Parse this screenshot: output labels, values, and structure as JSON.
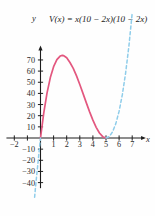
{
  "chart_data": {
    "type": "line",
    "title": "V(x) = x(10 − 2x)(10 − 2x)",
    "xlabel": "x",
    "ylabel": "y",
    "xlim": [
      -2.6,
      7.8
    ],
    "ylim": [
      -45,
      80
    ],
    "grid": false,
    "legend": null,
    "x_ticks": [
      -2,
      -1,
      1,
      2,
      3,
      4,
      5,
      6,
      7
    ],
    "x_tick_labels": [
      "−2",
      "",
      "1",
      "2",
      "3",
      "4",
      "5",
      "6",
      "7"
    ],
    "y_ticks": [
      -40,
      -30,
      -20,
      -10,
      10,
      20,
      30,
      40,
      50,
      60,
      70
    ],
    "y_tick_labels": [
      "−40",
      "−30",
      "−20",
      "−10",
      "10",
      "20",
      "30",
      "40",
      "50",
      "60",
      "70"
    ],
    "series": [
      {
        "name": "V(x) solid relevant domain",
        "style": "solid",
        "color": "#E3577F",
        "domain": [
          0,
          5
        ],
        "points": [
          {
            "x": 0.0,
            "y": 0
          },
          {
            "x": 0.25,
            "y": 22.56
          },
          {
            "x": 0.5,
            "y": 40.5
          },
          {
            "x": 0.75,
            "y": 54.19
          },
          {
            "x": 1.0,
            "y": 64.0
          },
          {
            "x": 1.25,
            "y": 70.31
          },
          {
            "x": 1.5,
            "y": 73.5
          },
          {
            "x": 1.667,
            "y": 74.07
          },
          {
            "x": 1.75,
            "y": 73.94
          },
          {
            "x": 2.0,
            "y": 72.0
          },
          {
            "x": 2.25,
            "y": 67.69
          },
          {
            "x": 2.5,
            "y": 62.5
          },
          {
            "x": 2.75,
            "y": 55.69
          },
          {
            "x": 3.0,
            "y": 48.0
          },
          {
            "x": 3.25,
            "y": 39.81
          },
          {
            "x": 3.5,
            "y": 31.5
          },
          {
            "x": 3.75,
            "y": 23.44
          },
          {
            "x": 4.0,
            "y": 16.0
          },
          {
            "x": 4.25,
            "y": 9.56
          },
          {
            "x": 4.5,
            "y": 4.5
          },
          {
            "x": 4.75,
            "y": 1.19
          },
          {
            "x": 5.0,
            "y": 0.0
          }
        ]
      },
      {
        "name": "V(x) dashed extension right",
        "style": "dashed",
        "color": "#8FCDEA",
        "domain": [
          5,
          7.3
        ],
        "points": [
          {
            "x": 5.0,
            "y": 0.0
          },
          {
            "x": 5.25,
            "y": 1.31
          },
          {
            "x": 5.5,
            "y": 5.5
          },
          {
            "x": 5.75,
            "y": 12.94
          },
          {
            "x": 6.0,
            "y": 24.0
          },
          {
            "x": 6.25,
            "y": 39.06
          },
          {
            "x": 6.5,
            "y": 58.5
          },
          {
            "x": 6.75,
            "y": 82.69
          },
          {
            "x": 7.0,
            "y": 112.0
          }
        ]
      },
      {
        "name": "V(x) dashed extension left",
        "style": "dashed",
        "color": "#8FCDEA",
        "domain": [
          -0.45,
          0
        ],
        "points": [
          {
            "x": -0.45,
            "y": -53.14
          },
          {
            "x": -0.4,
            "y": -46.66
          },
          {
            "x": -0.3,
            "y": -34.43
          },
          {
            "x": -0.2,
            "y": -23.23
          },
          {
            "x": -0.1,
            "y": -11.05
          },
          {
            "x": 0.0,
            "y": 0.0
          }
        ]
      }
    ],
    "annotations": {
      "peak_value": 74.07,
      "peak_x": 1.667,
      "roots": [
        0,
        5
      ]
    }
  },
  "axes": {
    "y_axis_name": "y",
    "x_axis_name": "x",
    "origin_label": ""
  },
  "colors": {
    "solid_curve": "#E3577F",
    "dashed_curve": "#8FCDEA",
    "axis": "#1d1d1d",
    "text": "#2a2a2a",
    "background": "#fefefe"
  }
}
